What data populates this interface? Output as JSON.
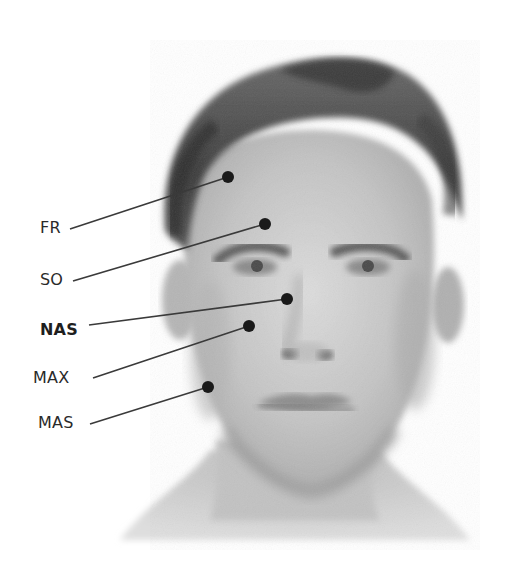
{
  "figure": {
    "colors": {
      "background": "#ffffff",
      "dot": "#1a1a1a",
      "leader_line": "#3a3a3a",
      "label_text": "#2a2a2a",
      "skin": "#c9c9c9",
      "hair": "#4a4a4a"
    },
    "points": [
      {
        "id": "FR",
        "label": "FR",
        "bold": false,
        "label_x": 40,
        "label_y": 220,
        "line_start": [
          70,
          229
        ],
        "dot": [
          228,
          177
        ]
      },
      {
        "id": "SO",
        "label": "SO",
        "bold": false,
        "label_x": 40,
        "label_y": 272,
        "line_start": [
          73,
          281
        ],
        "dot": [
          265,
          224
        ]
      },
      {
        "id": "NAS",
        "label": "NAS",
        "bold": true,
        "label_x": 40,
        "label_y": 322,
        "line_start": [
          89,
          325
        ],
        "dot": [
          287,
          299
        ]
      },
      {
        "id": "MAX",
        "label": "MAX",
        "bold": false,
        "label_x": 33,
        "label_y": 370,
        "line_start": [
          93,
          378
        ],
        "dot": [
          249,
          326
        ]
      },
      {
        "id": "MAS",
        "label": "MAS",
        "bold": false,
        "label_x": 38,
        "label_y": 415,
        "line_start": [
          90,
          424
        ],
        "dot": [
          208,
          387
        ]
      }
    ]
  }
}
